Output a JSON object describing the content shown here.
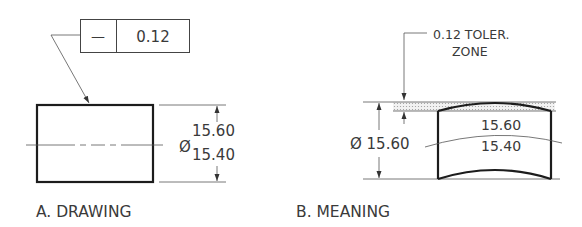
{
  "figure": {
    "panel_a": {
      "label": "A. DRAWING",
      "feature_control_frame": {
        "symbol": "—",
        "symbol_name": "straightness",
        "tolerance": "0.12"
      },
      "diameter_symbol": "Ø",
      "upper_limit": "15.60",
      "lower_limit": "15.40"
    },
    "panel_b": {
      "label": "B. MEANING",
      "zone_note_line1": "0.12 TOLER.",
      "zone_note_line2": "ZONE",
      "diameter_dim": "Ø 15.60",
      "upper_limit": "15.60",
      "lower_limit": "15.40"
    }
  },
  "colors": {
    "line": "#1c1c1c",
    "thin_line": "#555555",
    "text": "#3a3a3a",
    "background": "#ffffff"
  }
}
